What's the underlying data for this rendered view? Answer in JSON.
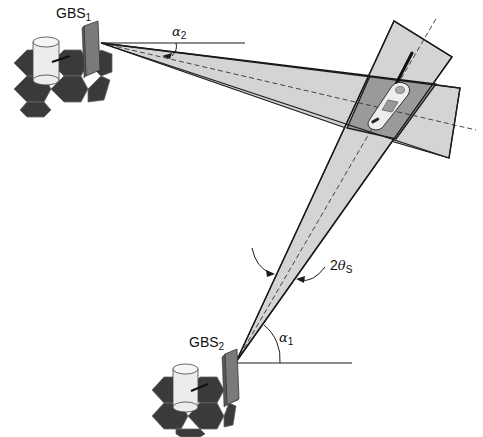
{
  "diagram": {
    "type": "two-base-station-localization",
    "colors": {
      "background": "#ffffff",
      "beam_fill": "#d4d4d4",
      "overlap_fill": "#9a9a9a",
      "outline": "#1a1a1a",
      "hex_tile": "#3a3a3a",
      "cylinder": "#ececec",
      "panel": "#7a7a7a"
    },
    "stations": [
      {
        "id": "gbs1",
        "name": "GBS",
        "subscript": "1",
        "apex": [
          101,
          43
        ]
      },
      {
        "id": "gbs2",
        "name": "GBS",
        "subscript": "2",
        "apex": [
          236,
          362
        ]
      }
    ],
    "angles": [
      {
        "id": "alpha2",
        "symbol": "α",
        "subscript": "2"
      },
      {
        "id": "alpha1",
        "symbol": "α",
        "subscript": "1"
      },
      {
        "id": "two-theta-s",
        "prefix": "2",
        "symbol": "θ",
        "subscript": "S"
      }
    ],
    "target": {
      "id": "mobile-handset",
      "label": ""
    }
  }
}
